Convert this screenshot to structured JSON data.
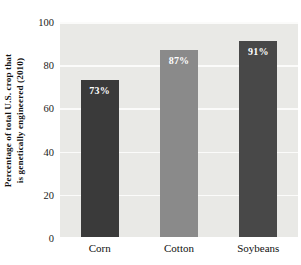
{
  "chart_data": {
    "type": "bar",
    "title": "",
    "xlabel": "",
    "ylabel_line1": "Percentage of total U.S. crop that",
    "ylabel_line2": "is genetically engineered (2010)",
    "categories": [
      "Corn",
      "Cotton",
      "Soybeans"
    ],
    "values": [
      73,
      87,
      91
    ],
    "value_labels": [
      "73%",
      "87%",
      "91%"
    ],
    "bar_colors": [
      "#3a3a3a",
      "#8a8a8a",
      "#484848"
    ],
    "ylim": [
      0,
      100
    ],
    "yticks": [
      0,
      20,
      40,
      60,
      80,
      100
    ],
    "ytick_labels": [
      "0",
      "20",
      "40",
      "60",
      "80",
      "100"
    ],
    "grid": "horizontal",
    "gridline_color": "#fbfbfa",
    "plot_background": "#e9e9e6",
    "figure_background": "#ffffff",
    "legend": "none",
    "value_label_color": "#ffffff"
  }
}
